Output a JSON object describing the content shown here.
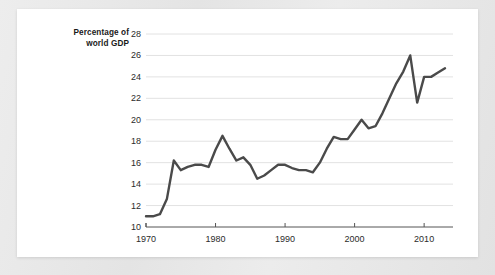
{
  "chart_data": {
    "type": "line",
    "title": "",
    "subtitle": "",
    "ylabel": "Percentage of\nworld GDP",
    "xlabel": "",
    "ylim": [
      10,
      28
    ],
    "xlim": [
      1970,
      2013
    ],
    "ytick_labels": [
      "10",
      "12",
      "14",
      "16",
      "18",
      "20",
      "22",
      "24",
      "26",
      "28"
    ],
    "yticks": [
      10,
      12,
      14,
      16,
      18,
      20,
      22,
      24,
      26,
      28
    ],
    "xtick_labels": [
      "1970",
      "1980",
      "1990",
      "2000",
      "2010"
    ],
    "xticks": [
      1970,
      1980,
      1990,
      2000,
      2010
    ],
    "grid": "horizontal",
    "legend": "none",
    "line_color": "#4a4a4a",
    "grid_color": "#e2e2e2",
    "axis_color": "#555555",
    "background": "#ffffff",
    "page_background": "#e8e8e8",
    "x": [
      1970,
      1971,
      1972,
      1973,
      1974,
      1975,
      1976,
      1977,
      1978,
      1979,
      1980,
      1981,
      1982,
      1983,
      1984,
      1985,
      1986,
      1987,
      1988,
      1989,
      1990,
      1991,
      1992,
      1993,
      1994,
      1995,
      1996,
      1997,
      1998,
      1999,
      2000,
      2001,
      2002,
      2003,
      2004,
      2005,
      2006,
      2007,
      2008,
      2009,
      2010,
      2011,
      2012,
      2013
    ],
    "values": [
      11.0,
      11.0,
      11.2,
      12.6,
      16.2,
      15.3,
      15.6,
      15.8,
      15.8,
      15.6,
      17.2,
      18.5,
      17.3,
      16.2,
      16.5,
      15.8,
      14.5,
      14.8,
      15.3,
      15.8,
      15.8,
      15.5,
      15.3,
      15.3,
      15.1,
      16.0,
      17.3,
      18.4,
      18.2,
      18.2,
      19.1,
      20.0,
      19.2,
      19.4,
      20.6,
      22.0,
      23.4,
      24.5,
      26.0,
      21.6,
      24.0,
      24.0,
      24.4,
      24.8
    ],
    "series_name": "Percentage of world GDP"
  },
  "figure": {
    "caption": ""
  }
}
